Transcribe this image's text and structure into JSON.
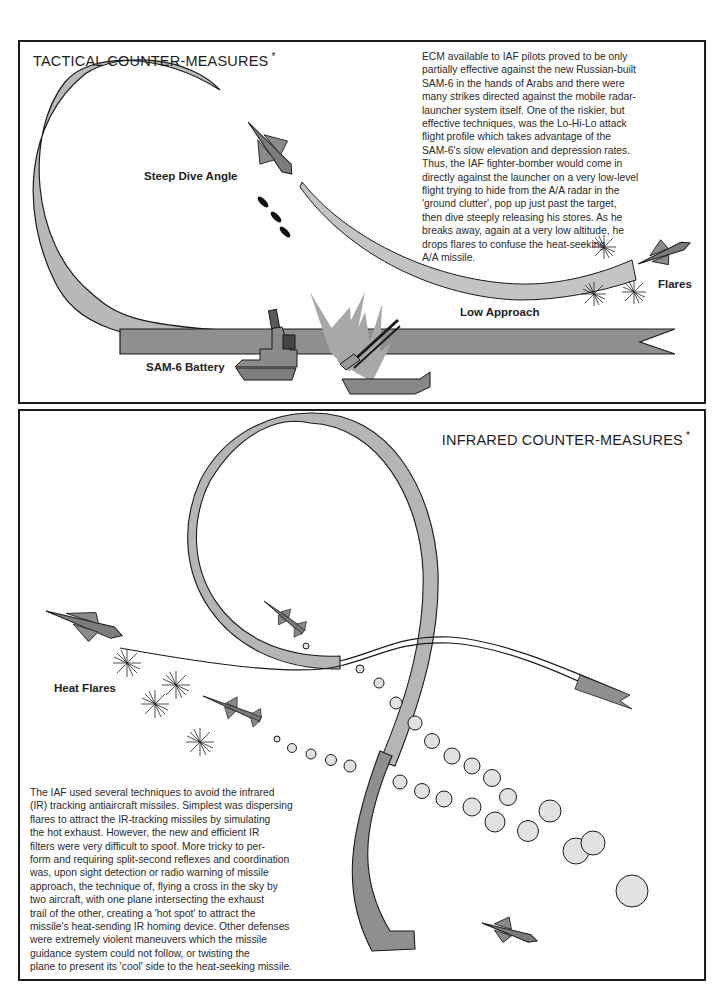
{
  "top_panel": {
    "title": "TACTICAL COUNTER-MEASURES",
    "title_mark": "*",
    "text_lines": [
      "ECM available to IAF pilots proved to be only",
      "partially effective against the new Russian-built",
      "SAM-6 in the hands of Arabs and there were",
      "many strikes directed against the mobile radar-",
      "launcher system itself. One of the riskier, but",
      "effective techniques, was the Lo-Hi-Lo attack",
      "flight profile which takes advantage of the",
      "SAM-6's slow elevation and depression rates.",
      "Thus, the IAF fighter-bomber would come in",
      "directly against the launcher on a very low-level",
      "flight trying to hide from the A/A radar in the",
      "'ground clutter', pop up just past the target,",
      "then dive steeply releasing his stores. As he",
      "breaks away, again at a very low altitude, he",
      "drops flares to confuse the heat-seeking",
      "A/A missile."
    ],
    "labels": {
      "steep_dive": "Steep Dive Angle",
      "low_approach": "Low Approach",
      "sam_battery": "SAM-6 Battery",
      "flares": "Flares"
    }
  },
  "bottom_panel": {
    "title": "INFRARED COUNTER-MEASURES",
    "title_mark": "*",
    "text_lines": [
      "The IAF used several techniques to avoid the infrared",
      "(IR) tracking antiaircraft missiles. Simplest was dispersing",
      "flares to attract the IR-tracking missiles by simulating",
      "the hot exhaust. However, the new and efficient IR",
      "filters were very difficult to spoof. More tricky to per-",
      "form and requiring split-second reflexes and coordination",
      "was, upon sight detection or radio warning of missile",
      "approach, the technique of, flying a cross in the sky by",
      "two aircraft, with one plane intersecting the exhaust",
      "trail of the other, creating a 'hot spot' to attract the",
      "missile's heat-sending IR homing device. Other defenses",
      "were extremely violent maneuvers which the missile",
      "guidance system could not follow, or twisting the",
      "plane to present its 'cool' side to the heat-seeking missile."
    ],
    "labels": {
      "heat_flares": "Heat Flares"
    }
  },
  "colors": {
    "ribbon_light": "#b9b9b9",
    "ribbon_dark": "#8c8c8c",
    "ink": "#1b1b1b",
    "smoke": "#dedede"
  }
}
